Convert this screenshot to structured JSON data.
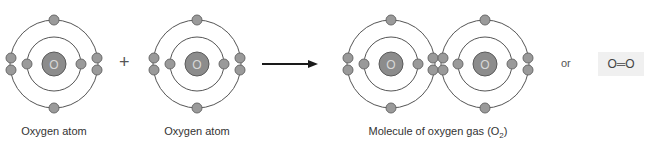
{
  "diagram": {
    "atoms": [
      {
        "symbol": "O",
        "label": "Oxygen atom"
      },
      {
        "symbol": "O",
        "label": "Oxygen atom"
      }
    ],
    "operator": "+",
    "arrow": "yields-arrow",
    "molecule": {
      "label_prefix": "Molecule of oxygen gas (O",
      "label_subscript": "2",
      "label_suffix": ")",
      "atom_symbols": [
        "O",
        "O"
      ]
    },
    "or_text": "or",
    "structural_formula": "O═O"
  },
  "colors": {
    "orbit": "#555555",
    "electron_fill": "#9a9a9a",
    "electron_stroke": "#6a6a6a",
    "nucleus_fill": "#8c8c8c",
    "nucleus_stroke": "#5a5a5a",
    "nucleus_text": "#d8d8d8",
    "arrow": "#1a1a1a",
    "formula_bg": "#f0f0f0"
  }
}
